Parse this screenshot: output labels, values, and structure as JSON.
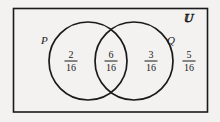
{
  "diagram": {
    "type": "venn-two-set",
    "universe": {
      "symbol": "U",
      "display": "𝕌",
      "name": "universal-set"
    },
    "sets": [
      {
        "id": "P",
        "label": "P",
        "region_value": "2",
        "region_denominator": "16"
      },
      {
        "id": "Q",
        "label": "Q",
        "region_value": "3",
        "region_denominator": "16"
      }
    ],
    "regions": [
      {
        "name": "p-only",
        "label": "P only",
        "numerator": "2",
        "denominator": "16",
        "value": 0.125
      },
      {
        "name": "intersection",
        "label": "P and Q",
        "numerator": "6",
        "denominator": "16",
        "value": 0.375
      },
      {
        "name": "q-only",
        "label": "Q only",
        "numerator": "3",
        "denominator": "16",
        "value": 0.1875
      },
      {
        "name": "outside",
        "label": "Neither P nor Q",
        "numerator": "5",
        "denominator": "16",
        "value": 0.3125
      }
    ],
    "colors": {
      "stroke": "#1a1a1a",
      "background": "#f3f2f0",
      "text": "#1a1a1a"
    }
  }
}
